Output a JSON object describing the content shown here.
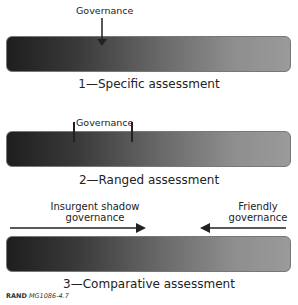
{
  "panels": [
    {
      "label": "Governance",
      "caption": "1—Specific assessment",
      "marker": "arrow"
    },
    {
      "label": "Governance",
      "caption": "2—Ranged assessment",
      "marker": "range-ticks"
    },
    {
      "left_label_line1": "Insurgent shadow",
      "left_label_line2": "governance",
      "right_label_line1": "Friendly",
      "right_label_line2": "governance",
      "caption": "3—Comparative assessment",
      "marker": "opposing-arrows"
    }
  ],
  "footer": {
    "org": "RAND",
    "id": "MG1086-4.7"
  },
  "colors": {
    "bar_dark": "#1e1e1e",
    "bar_light": "#9a9a9a",
    "text": "#222222"
  }
}
